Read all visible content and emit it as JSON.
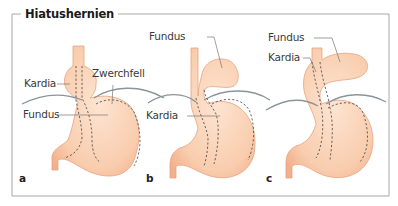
{
  "figure": {
    "title": "Hiatushernien",
    "colors": {
      "stomach_fill": "#f9cfb0",
      "stomach_stroke": "#e8a27e",
      "diaphragm": "#8a9599",
      "frame": "#9a9a9a",
      "dashed": "#4a4a4a",
      "leader": "#777777"
    },
    "panels": [
      {
        "letter": "a",
        "labels": {
          "kardia": "Kardia",
          "zwerchfell": "Zwerchfell",
          "fundus": "Fundus"
        }
      },
      {
        "letter": "b",
        "labels": {
          "fundus": "Fundus",
          "kardia": "Kardia"
        }
      },
      {
        "letter": "c",
        "labels": {
          "fundus": "Fundus",
          "kardia": "Kardia"
        }
      }
    ]
  }
}
